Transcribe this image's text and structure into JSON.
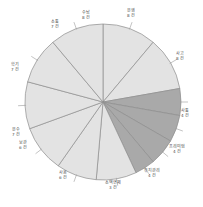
{
  "chart_data": {
    "type": "pie",
    "title": "",
    "subtitle": "",
    "xlabel": "",
    "ylabel": "",
    "legend_position": "labels-outside",
    "grid": false,
    "unit_suffix": "건",
    "total": 69,
    "colors": {
      "light_slice": "#e3e3e3",
      "dark_slice": "#a9a9a9",
      "slice_border": "#8e8e8e",
      "leader_line": "#9a9a9a",
      "label_text": "#4a4a4a",
      "background": "#ffffff"
    },
    "categories": [
      "운행",
      "사고",
      "사통",
      "프리미엄",
      "유지관리",
      "소액연체",
      "사용",
      "보관",
      "운수",
      "학기",
      "소통",
      "수납"
    ],
    "values": [
      8,
      8,
      4,
      4,
      4,
      3,
      6,
      6,
      7,
      7,
      7,
      8
    ],
    "slices": [
      {
        "label": "운행",
        "count": 8,
        "count_text": "8 건",
        "shade": "light",
        "label_x": 131,
        "label_y": 14
      },
      {
        "label": "사고",
        "count": 8,
        "count_text": "8 건",
        "shade": "light",
        "label_x": 180,
        "label_y": 57
      },
      {
        "label": "사통",
        "count": 4,
        "count_text": "4 건",
        "shade": "dark",
        "label_x": 185,
        "label_y": 114
      },
      {
        "label": "프리미엄",
        "count": 4,
        "count_text": "4 건",
        "shade": "dark",
        "label_x": 177,
        "label_y": 150
      },
      {
        "label": "유지관리",
        "count": 4,
        "count_text": "4 건",
        "shade": "dark",
        "label_x": 152,
        "label_y": 174
      },
      {
        "label": "소액연체",
        "count": 3,
        "count_text": "3 건",
        "shade": "dark",
        "label_x": 113,
        "label_y": 186
      },
      {
        "label": "사용",
        "count": 6,
        "count_text": "6 건",
        "shade": "light",
        "label_x": 63,
        "label_y": 176
      },
      {
        "label": "보관",
        "count": 6,
        "count_text": "6 건",
        "shade": "light",
        "label_x": 23,
        "label_y": 146
      },
      {
        "label": "운수",
        "count": 7,
        "count_text": "7 건",
        "shade": "light",
        "label_x": 16,
        "label_y": 133
      },
      {
        "label": "학기",
        "count": 7,
        "count_text": "7 건",
        "shade": "light",
        "label_x": 15,
        "label_y": 68
      },
      {
        "label": "소통",
        "count": 7,
        "count_text": "7 건",
        "shade": "light",
        "label_x": 55,
        "label_y": 25
      },
      {
        "label": "수납",
        "count": 8,
        "count_text": "8 건",
        "shade": "light",
        "label_x": 86,
        "label_y": 16
      }
    ],
    "geometry": {
      "center_x": 103,
      "center_y": 102,
      "radius": 78
    }
  }
}
